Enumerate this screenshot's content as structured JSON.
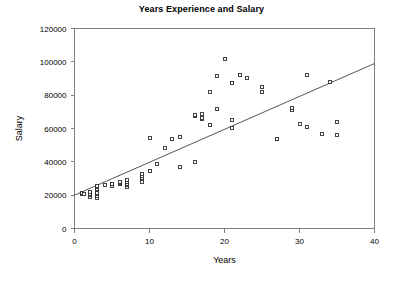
{
  "chart_data": {
    "type": "scatter",
    "title": "Years Experience and Salary",
    "xlabel": "Years",
    "ylabel": "Salary",
    "xlim": [
      0,
      40
    ],
    "ylim": [
      0,
      120000
    ],
    "xticks": [
      "0",
      "10",
      "20",
      "30",
      "40"
    ],
    "xtick_values": [
      0,
      10,
      20,
      30,
      40
    ],
    "yticks": [
      "0",
      "20000",
      "40000",
      "60000",
      "80000",
      "100000",
      "120000"
    ],
    "ytick_values": [
      0,
      20000,
      40000,
      60000,
      80000,
      100000,
      120000
    ],
    "grid": false,
    "legend": "none",
    "marker_style": "open-square",
    "points": [
      [
        1,
        21000
      ],
      [
        1,
        21500
      ],
      [
        1.2,
        20500
      ],
      [
        2,
        19000
      ],
      [
        2,
        20000
      ],
      [
        2,
        21000
      ],
      [
        2,
        22000
      ],
      [
        3,
        18500
      ],
      [
        3,
        19500
      ],
      [
        3,
        20500
      ],
      [
        3,
        21500
      ],
      [
        3,
        23000
      ],
      [
        3,
        24000
      ],
      [
        3,
        25000
      ],
      [
        3,
        25500
      ],
      [
        4,
        26000
      ],
      [
        5,
        25500
      ],
      [
        5,
        26500
      ],
      [
        5,
        27000
      ],
      [
        6,
        26500
      ],
      [
        6,
        27500
      ],
      [
        6,
        28000
      ],
      [
        7,
        25000
      ],
      [
        7,
        26000
      ],
      [
        7,
        27000
      ],
      [
        7,
        28000
      ],
      [
        7,
        29000
      ],
      [
        9,
        28000
      ],
      [
        9,
        29500
      ],
      [
        9,
        30500
      ],
      [
        9,
        31500
      ],
      [
        9,
        32500
      ],
      [
        10,
        34500
      ],
      [
        10,
        54500
      ],
      [
        11,
        38500
      ],
      [
        12,
        48500
      ],
      [
        13,
        53500
      ],
      [
        14,
        37000
      ],
      [
        14,
        55000
      ],
      [
        16,
        40000
      ],
      [
        16,
        67500
      ],
      [
        16,
        68000
      ],
      [
        17,
        65500
      ],
      [
        17,
        66500
      ],
      [
        17,
        69000
      ],
      [
        18,
        62000
      ],
      [
        18,
        82000
      ],
      [
        19,
        72000
      ],
      [
        19,
        91500
      ],
      [
        20,
        101500
      ],
      [
        21,
        60500
      ],
      [
        21,
        65000
      ],
      [
        21,
        87500
      ],
      [
        22,
        92000
      ],
      [
        23,
        90500
      ],
      [
        25,
        82000
      ],
      [
        25,
        85000
      ],
      [
        27,
        53500
      ],
      [
        27,
        54000
      ],
      [
        29,
        71000
      ],
      [
        29,
        72500
      ],
      [
        30,
        63000
      ],
      [
        31,
        61000
      ],
      [
        31,
        92000
      ],
      [
        33,
        57000
      ],
      [
        34,
        88000
      ],
      [
        35,
        56000
      ],
      [
        35,
        64000
      ]
    ],
    "trendline": {
      "type": "linear",
      "x_start": 0,
      "y_start": 20000,
      "x_end": 40,
      "y_end": 99000
    }
  }
}
